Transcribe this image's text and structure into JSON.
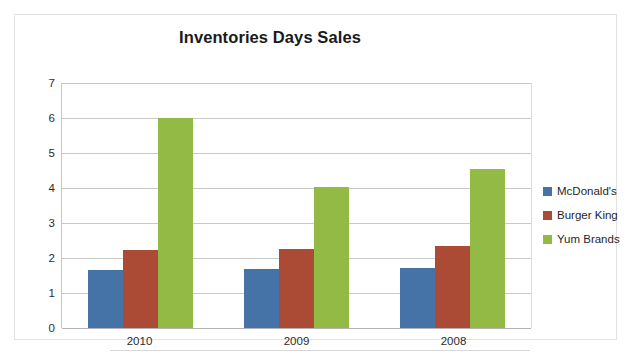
{
  "chart_data": {
    "type": "bar",
    "title": "Inventories Days Sales",
    "xlabel": "",
    "ylabel": "",
    "categories": [
      "2010",
      "2009",
      "2008"
    ],
    "series": [
      {
        "name": "McDonald's",
        "color": "#4573a7",
        "values": [
          1.65,
          1.68,
          1.71
        ]
      },
      {
        "name": "Burger King",
        "color": "#ab4b35",
        "values": [
          2.22,
          2.25,
          2.35
        ]
      },
      {
        "name": "Yum Brands",
        "color": "#93ba45",
        "values": [
          6.0,
          4.03,
          4.55
        ]
      }
    ],
    "ylim": [
      0,
      7
    ],
    "ytick_labels": [
      "7",
      "6",
      "5",
      "4",
      "3",
      "2",
      "1",
      "0"
    ],
    "ytick_values": [
      7,
      6,
      5,
      4,
      3,
      2,
      1,
      0
    ],
    "grid": true,
    "legend_position": "right",
    "legend": [
      "McDonald's",
      "Burger King",
      "Yum Brands"
    ]
  }
}
